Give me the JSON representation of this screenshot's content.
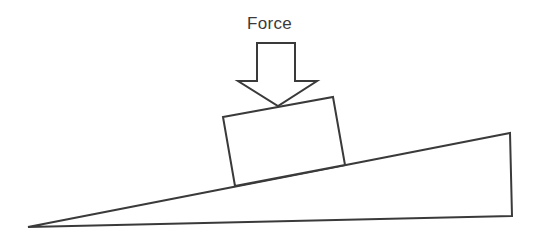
{
  "diagram": {
    "force_label": "Force",
    "stroke_color": "#3a3a3a",
    "background_color": "#ffffff",
    "elements": {
      "wedge": {
        "points": [
          [
            28,
            227
          ],
          [
            510,
            133
          ],
          [
            512,
            216
          ]
        ]
      },
      "block": {
        "points": [
          [
            223,
            117
          ],
          [
            333,
            97
          ],
          [
            345,
            165
          ],
          [
            235,
            186
          ]
        ]
      },
      "arrow": {
        "points": [
          [
            257,
            43
          ],
          [
            295,
            43
          ],
          [
            295,
            81
          ],
          [
            317,
            81
          ],
          [
            278,
            106
          ],
          [
            238,
            81
          ],
          [
            257,
            81
          ]
        ]
      }
    }
  }
}
